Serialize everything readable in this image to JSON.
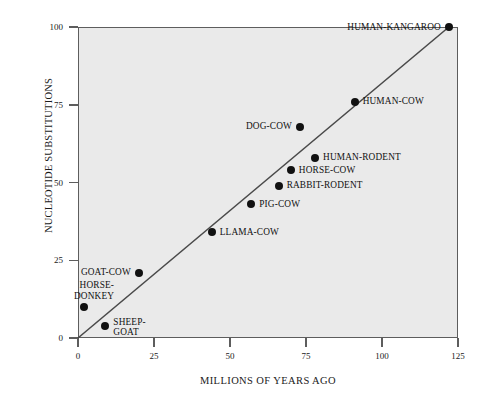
{
  "chart_data": {
    "type": "scatter",
    "title": "",
    "xlabel": "MILLIONS OF YEARS AGO",
    "ylabel": "NUCLEOTIDE SUBSTITUTIONS",
    "xlim": [
      0,
      125
    ],
    "ylim": [
      0,
      100
    ],
    "xticks": [
      0,
      25,
      50,
      75,
      100,
      125
    ],
    "yticks": [
      0,
      25,
      50,
      75,
      100
    ],
    "xtick_labels": [
      "0",
      "25",
      "50",
      "75",
      "100",
      "125"
    ],
    "ytick_labels": [
      "0",
      "25",
      "50",
      "75",
      "100"
    ],
    "grid": false,
    "legend": "none",
    "background": "#eaeaea",
    "point_color": "#111111",
    "line_color": "#4a4a4a",
    "trendline": {
      "x0": 0,
      "y0": 0,
      "x1": 122,
      "y1": 100
    },
    "points": [
      {
        "label": "HUMAN-KANGAROO",
        "x": 122,
        "y": 100,
        "label_side": "left"
      },
      {
        "label": "HUMAN-COW",
        "x": 91,
        "y": 76,
        "label_side": "right"
      },
      {
        "label": "DOG-COW",
        "x": 73,
        "y": 68,
        "label_side": "left"
      },
      {
        "label": "HUMAN-RODENT",
        "x": 78,
        "y": 58,
        "label_side": "right"
      },
      {
        "label": "HORSE-COW",
        "x": 70,
        "y": 54,
        "label_side": "right"
      },
      {
        "label": "RABBIT-RODENT",
        "x": 66,
        "y": 49,
        "label_side": "right"
      },
      {
        "label": "PIG-COW",
        "x": 57,
        "y": 43,
        "label_side": "right"
      },
      {
        "label": "LLAMA-COW",
        "x": 44,
        "y": 34,
        "label_side": "right"
      },
      {
        "label": "GOAT-COW",
        "x": 20,
        "y": 21,
        "label_side": "left"
      },
      {
        "label": "HORSE-\nDONKEY",
        "x": 2,
        "y": 10,
        "label_side": "above"
      },
      {
        "label": "SHEEP-\nGOAT",
        "x": 9,
        "y": 4,
        "label_side": "right-below"
      }
    ]
  }
}
